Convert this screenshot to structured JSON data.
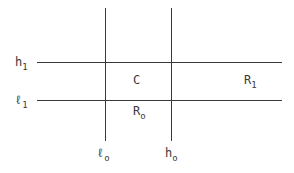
{
  "diagram": {
    "lines": {
      "horizontal": [
        {
          "id": "h1",
          "y": 62,
          "x1": 37,
          "x2": 282
        },
        {
          "id": "l1",
          "y": 100,
          "x1": 37,
          "x2": 282
        }
      ],
      "vertical": [
        {
          "id": "l0",
          "x": 105,
          "y1": 8,
          "y2": 141
        },
        {
          "id": "h0",
          "x": 171,
          "y1": 8,
          "y2": 141
        }
      ]
    },
    "labels": {
      "h1": {
        "base": "h",
        "sub": "1"
      },
      "l1": {
        "base": "ℓ",
        "sub": "1"
      },
      "l0": {
        "base": "ℓ",
        "sub": "o"
      },
      "h0": {
        "base": "h",
        "sub": "o"
      },
      "C": {
        "base": "C",
        "sub": ""
      },
      "R1": {
        "base": "R",
        "sub": "1"
      },
      "R0": {
        "base": "R",
        "sub": "o"
      }
    }
  }
}
